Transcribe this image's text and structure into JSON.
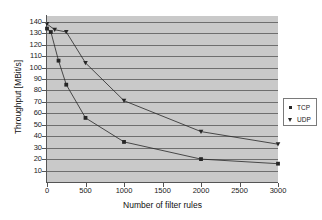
{
  "chart_data": {
    "type": "line",
    "title": "",
    "xlabel": "Number of filter rules",
    "ylabel": "Throughput [MBit/s]",
    "xlim": [
      0,
      3000
    ],
    "ylim": [
      0,
      145
    ],
    "xticks": [
      0,
      500,
      1000,
      1500,
      2000,
      2500,
      3000
    ],
    "yticks": [
      10,
      20,
      30,
      40,
      50,
      60,
      70,
      80,
      90,
      100,
      110,
      120,
      130,
      140
    ],
    "grid": "horizontal",
    "legend_position": "right-outside",
    "plot_background": "#c9c9c9",
    "series": [
      {
        "name": "TCP",
        "marker": "square",
        "color": "#262626",
        "points": [
          {
            "x": 0,
            "y": 134
          },
          {
            "x": 50,
            "y": 131
          },
          {
            "x": 150,
            "y": 106
          },
          {
            "x": 250,
            "y": 85
          },
          {
            "x": 500,
            "y": 56
          },
          {
            "x": 1000,
            "y": 35
          },
          {
            "x": 2000,
            "y": 20
          },
          {
            "x": 3000,
            "y": 16
          }
        ]
      },
      {
        "name": "UDP",
        "marker": "triangle",
        "color": "#262626",
        "points": [
          {
            "x": 0,
            "y": 138
          },
          {
            "x": 100,
            "y": 133
          },
          {
            "x": 250,
            "y": 131
          },
          {
            "x": 500,
            "y": 104
          },
          {
            "x": 1000,
            "y": 71
          },
          {
            "x": 2000,
            "y": 44
          },
          {
            "x": 3000,
            "y": 33
          }
        ]
      }
    ]
  },
  "legend": {
    "items": [
      {
        "label": "TCP",
        "marker": "square"
      },
      {
        "label": "UDP",
        "marker": "triangle"
      }
    ]
  },
  "axes": {
    "x_title": "Number of filter rules",
    "y_title": "Throughput [MBit/s]"
  }
}
